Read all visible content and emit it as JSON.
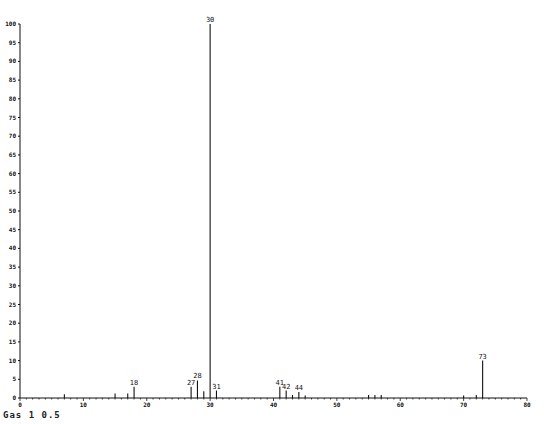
{
  "footer_text": "Gas 1 0.5",
  "chart_data": {
    "type": "bar",
    "title": "",
    "xlabel": "m/z",
    "ylabel": "Relative abundance (%)",
    "xlim": [
      0,
      80
    ],
    "ylim": [
      0,
      100
    ],
    "x_ticks": [
      0,
      10,
      20,
      30,
      40,
      50,
      60,
      70,
      80
    ],
    "y_ticks": [
      0,
      5,
      10,
      15,
      20,
      25,
      30,
      35,
      40,
      45,
      50,
      55,
      60,
      65,
      70,
      75,
      80,
      85,
      90,
      95,
      100
    ],
    "grid": false,
    "peaks": [
      {
        "x": 7,
        "y": 1.0,
        "label": ""
      },
      {
        "x": 15,
        "y": 1.2,
        "label": ""
      },
      {
        "x": 17,
        "y": 1.2,
        "label": ""
      },
      {
        "x": 18,
        "y": 3.0,
        "label": "18"
      },
      {
        "x": 27,
        "y": 3.0,
        "label": "27"
      },
      {
        "x": 28,
        "y": 4.7,
        "label": "28"
      },
      {
        "x": 29,
        "y": 1.8,
        "label": ""
      },
      {
        "x": 30,
        "y": 100,
        "label": "30"
      },
      {
        "x": 31,
        "y": 2.0,
        "label": "31"
      },
      {
        "x": 41,
        "y": 3.0,
        "label": "41"
      },
      {
        "x": 42,
        "y": 2.0,
        "label": "42"
      },
      {
        "x": 43,
        "y": 0.8,
        "label": ""
      },
      {
        "x": 44,
        "y": 1.6,
        "label": "44"
      },
      {
        "x": 45,
        "y": 0.7,
        "label": ""
      },
      {
        "x": 55,
        "y": 0.8,
        "label": ""
      },
      {
        "x": 56,
        "y": 0.8,
        "label": ""
      },
      {
        "x": 57,
        "y": 0.8,
        "label": ""
      },
      {
        "x": 70,
        "y": 0.7,
        "label": ""
      },
      {
        "x": 72,
        "y": 0.8,
        "label": ""
      },
      {
        "x": 73,
        "y": 10.0,
        "label": "73"
      }
    ]
  }
}
